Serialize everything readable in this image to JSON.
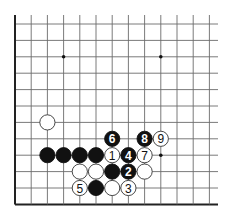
{
  "diagram": {
    "type": "go-board-fragment",
    "grid": {
      "origin_x": 15,
      "origin_y": 24,
      "spacing_x": 16.2,
      "spacing_y": 16.4,
      "cols": 13,
      "rows": 12,
      "right_open": true,
      "top_open": true,
      "left_edge": true,
      "bottom_edge": true,
      "line_color": "#6b6b6b",
      "edge_color": "#222222"
    },
    "star_points": [
      {
        "col": 3,
        "row": 2
      },
      {
        "col": 9,
        "row": 2
      },
      {
        "col": 9,
        "row": 8
      }
    ],
    "stones": [
      {
        "color": "white",
        "col": 2,
        "row": 6,
        "label": ""
      },
      {
        "color": "black",
        "col": 6,
        "row": 7,
        "label": "6"
      },
      {
        "color": "black",
        "col": 8,
        "row": 7,
        "label": "8"
      },
      {
        "color": "white",
        "col": 9,
        "row": 7,
        "label": "9"
      },
      {
        "color": "black",
        "col": 2,
        "row": 8,
        "label": ""
      },
      {
        "color": "black",
        "col": 3,
        "row": 8,
        "label": ""
      },
      {
        "color": "black",
        "col": 4,
        "row": 8,
        "label": ""
      },
      {
        "color": "black",
        "col": 5,
        "row": 8,
        "label": ""
      },
      {
        "color": "white",
        "col": 6,
        "row": 8,
        "label": "1"
      },
      {
        "color": "black",
        "col": 7,
        "row": 8,
        "label": "4"
      },
      {
        "color": "white",
        "col": 8,
        "row": 8,
        "label": "7"
      },
      {
        "color": "white",
        "col": 4,
        "row": 9,
        "label": ""
      },
      {
        "color": "white",
        "col": 5,
        "row": 9,
        "label": ""
      },
      {
        "color": "black",
        "col": 6,
        "row": 9,
        "label": ""
      },
      {
        "color": "black",
        "col": 7,
        "row": 9,
        "label": "2"
      },
      {
        "color": "white",
        "col": 8,
        "row": 9,
        "label": ""
      },
      {
        "color": "white",
        "col": 4,
        "row": 10,
        "label": "5"
      },
      {
        "color": "black",
        "col": 5,
        "row": 10,
        "label": ""
      },
      {
        "color": "white",
        "col": 6,
        "row": 10,
        "label": ""
      },
      {
        "color": "white",
        "col": 7,
        "row": 10,
        "label": "3"
      }
    ]
  }
}
